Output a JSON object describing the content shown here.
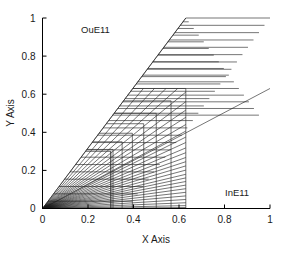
{
  "figure": {
    "background": "#ffffff",
    "width": 282,
    "height": 254
  },
  "chart_data": {
    "type": "line",
    "title": "",
    "xlabel": "X Axis",
    "ylabel": "Y Axis",
    "xlim": [
      0,
      1
    ],
    "ylim": [
      0,
      1
    ],
    "grid": false,
    "legend": "none",
    "xticks": [
      0,
      0.2,
      0.4,
      0.6,
      0.8,
      1
    ],
    "yticks": [
      0,
      0.2,
      0.4,
      0.6,
      0.8,
      1
    ],
    "xticklabels": [
      "0",
      "0.2",
      "0.4",
      "0.6",
      "0.8",
      "1"
    ],
    "yticklabels": [
      "0",
      "0.2",
      "0.4",
      "0.6",
      "0.8",
      "1"
    ],
    "annotations": [
      {
        "text": "OuE11",
        "x": 0.17,
        "y": 0.94,
        "name": "outer-envelope-label"
      },
      {
        "text": "InE11",
        "x": 0.8,
        "y": 0.185,
        "name": "inner-envelope-label"
      }
    ],
    "series": [
      {
        "name": "outer-envelope",
        "comment": "steep bounding ray from origin to (0.63,1)",
        "x": [
          0,
          0.63
        ],
        "y": [
          0,
          1
        ]
      },
      {
        "name": "inner-envelope",
        "comment": "shallow bounding ray from origin to (1,0.63)",
        "x": [
          0,
          1
        ],
        "y": [
          0,
          0.63
        ]
      },
      {
        "name": "ray-fan",
        "comment": "rays from origin, terminal points on the staircase boundary",
        "slopes": [
          1.587,
          1.42,
          1.28,
          1.16,
          1.06,
          0.97,
          0.89,
          0.82,
          0.76,
          0.7,
          0.645,
          0.595,
          0.55,
          0.505,
          0.465,
          0.425,
          0.39,
          0.355,
          0.32,
          0.285,
          0.255,
          0.225,
          0.195,
          0.165,
          0.135,
          0.105,
          0.075,
          0.048,
          0.024,
          0.008
        ]
      },
      {
        "name": "staircase-corners",
        "comment": "corner coordinates (c,c) of nested rectangles along the diagonal",
        "corners": [
          0.63,
          0.565,
          0.5,
          0.445,
          0.395,
          0.35,
          0.31,
          0.3
        ]
      },
      {
        "name": "horizontal-chords",
        "comment": "horizontal segments spanning from the outer envelope to the diagonal apex region",
        "y_values": [
          0.98,
          0.945,
          0.91,
          0.875,
          0.84,
          0.805,
          0.77,
          0.735,
          0.7,
          0.665,
          0.63,
          0.595,
          0.56,
          0.525,
          0.49
        ]
      }
    ]
  }
}
